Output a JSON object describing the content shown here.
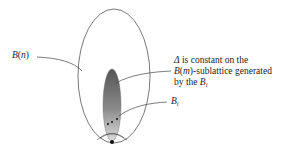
{
  "diagram": {
    "labels": {
      "outer_set": {
        "script_letter": "B",
        "open": "(",
        "arg": "n",
        "close": ")"
      },
      "sub_blocks": {
        "letter": "B",
        "subscript": "i"
      },
      "annotation": {
        "line1_symbol": "Δ",
        "line1_text": " is constant on the",
        "line2_script_letter": "B",
        "line2_open": "(",
        "line2_arg": "m",
        "line2_rest": ")-sublattice generated",
        "line3_text": "by the ",
        "line3_letter": "B",
        "line3_subscript": "i"
      }
    },
    "shapes": {
      "outer_ellipse": {
        "cx": 114,
        "cy": 76,
        "rx": 36,
        "ry": 67,
        "stroke": "#555555"
      },
      "inner_ellipse": {
        "cx": 112,
        "cy": 105,
        "rx": 9,
        "ry": 36,
        "gradient_top": "#5a5a5a",
        "gradient_bottom": "#d8d8d8"
      },
      "apex_dot": {
        "cx": 112,
        "cy": 142,
        "r": 2,
        "fill": "#111111"
      },
      "block_dots": [
        {
          "cx": 108,
          "cy": 124,
          "r": 1
        },
        {
          "cx": 112,
          "cy": 122,
          "r": 1
        },
        {
          "cx": 117,
          "cy": 119,
          "r": 1
        }
      ]
    },
    "colors": {
      "stroke": "#444444",
      "text": "#1e1e1e",
      "background": "#ffffff"
    }
  }
}
